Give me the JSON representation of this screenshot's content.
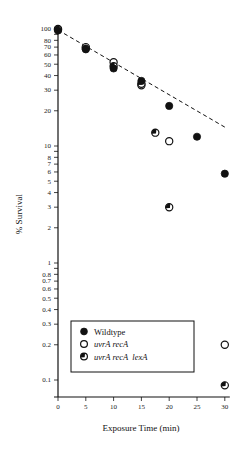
{
  "chart_data": {
    "type": "scatter",
    "title": "",
    "xlabel": "Exposure Time (min)",
    "ylabel": "% Survival",
    "xscale": "linear",
    "yscale": "log",
    "xlim": [
      0,
      30
    ],
    "ylim": [
      0.07,
      100
    ],
    "x_ticks": [
      0,
      5,
      10,
      15,
      20,
      25,
      30
    ],
    "y_ticks_labeled": [
      100,
      80,
      70,
      60,
      50,
      40,
      30,
      20,
      10,
      8,
      7,
      6,
      5,
      4,
      3,
      2,
      1,
      0.8,
      0.7,
      0.6,
      0.5,
      0.4,
      0.3,
      0.2,
      0.1
    ],
    "y_tick_labels": [
      "100",
      "80",
      "70",
      "60",
      "50",
      "40",
      "30",
      "20",
      "10",
      "8",
      "7",
      "6",
      "5",
      "4",
      "3",
      "2",
      "1",
      "0.8",
      "0.7",
      "0.6",
      "0.5",
      "0.4",
      "0.3",
      "0.2",
      "0.1"
    ],
    "grid": false,
    "legend_position": "lower-left inside",
    "series": [
      {
        "name": "Wildtype",
        "marker": "filled-circle",
        "italic": false,
        "points": [
          {
            "x": 0,
            "y": 97
          },
          {
            "x": 5,
            "y": 67
          },
          {
            "x": 10,
            "y": 46
          },
          {
            "x": 15,
            "y": 36
          },
          {
            "x": 20,
            "y": 22
          },
          {
            "x": 25,
            "y": 12
          },
          {
            "x": 30,
            "y": 5.8
          }
        ]
      },
      {
        "name": "uvrA recA",
        "marker": "open-circle",
        "italic": true,
        "points": [
          {
            "x": 0,
            "y": 100
          },
          {
            "x": 5,
            "y": 70
          },
          {
            "x": 10,
            "y": 52
          },
          {
            "x": 15,
            "y": 33
          },
          {
            "x": 20,
            "y": 11
          },
          {
            "x": 30,
            "y": 0.2
          }
        ]
      },
      {
        "name": "uvrA recA  lexA",
        "marker": "half-filled-circle",
        "italic": true,
        "points": [
          {
            "x": 0,
            "y": 99
          },
          {
            "x": 5,
            "y": 68
          },
          {
            "x": 10,
            "y": 48
          },
          {
            "x": 15,
            "y": 34
          },
          {
            "x": 17.5,
            "y": 13
          },
          {
            "x": 20,
            "y": 3
          },
          {
            "x": 30,
            "y": 0.09
          }
        ]
      }
    ],
    "annotations": [
      {
        "type": "dashed-line",
        "label": "trend",
        "from": {
          "x": 0,
          "y": 98
        },
        "to": {
          "x": 30,
          "y": 14.5
        }
      }
    ]
  },
  "legend": {
    "items": [
      {
        "label": "Wildtype",
        "marker": "filled-circle"
      },
      {
        "label": "uvrA recA",
        "marker": "open-circle"
      },
      {
        "label": "uvrA recA  lexA",
        "marker": "half-filled-circle"
      }
    ]
  },
  "colors": {
    "ink": "#111111",
    "background": "#ffffff"
  }
}
